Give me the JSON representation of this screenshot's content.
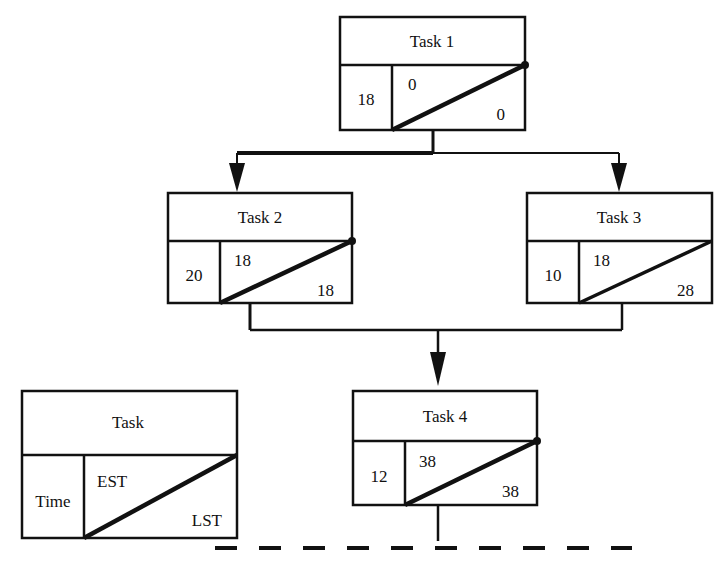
{
  "diagram": {
    "type": "precedence-network-diagram",
    "title_text": "",
    "stroke_color": "#111111",
    "background_color": "#ffffff",
    "nodes": [
      {
        "id": "task-1",
        "label": "Task 1",
        "time": "18",
        "est": "0",
        "lst": "0",
        "box": {
          "x": 340,
          "y": 17,
          "w": 185,
          "h": 113
        },
        "header_h": 48,
        "split_x": 52
      },
      {
        "id": "task-2",
        "label": "Task 2",
        "time": "20",
        "est": "18",
        "lst": "18",
        "box": {
          "x": 168,
          "y": 193,
          "w": 184,
          "h": 110
        },
        "header_h": 48,
        "split_x": 52
      },
      {
        "id": "task-3",
        "label": "Task 3",
        "time": "10",
        "est": "18",
        "lst": "28",
        "box": {
          "x": 527,
          "y": 193,
          "w": 185,
          "h": 110
        },
        "header_h": 48,
        "split_x": 52
      },
      {
        "id": "task-4",
        "label": "Task 4",
        "time": "12",
        "est": "38",
        "lst": "38",
        "box": {
          "x": 353,
          "y": 391,
          "w": 184,
          "h": 114
        },
        "header_h": 48,
        "split_x": 52
      }
    ],
    "legend": {
      "id": "legend-key",
      "label": "Task",
      "time": "Time",
      "est": "EST",
      "lst": "LST",
      "box": {
        "x": 22,
        "y": 391,
        "w": 215,
        "h": 147
      },
      "header_h": 64,
      "split_x": 62
    },
    "connectors": [
      {
        "id": "task1-to-task2",
        "from": "task-1",
        "to": "task-2",
        "style": "elbow-down-left-arrow"
      },
      {
        "id": "task1-to-task3",
        "from": "task-1",
        "to": "task-3",
        "style": "elbow-down-right-arrow"
      },
      {
        "id": "task2-to-task4",
        "from": "task-2",
        "to": "task-4",
        "style": "elbow-down-merge-arrow"
      },
      {
        "id": "task3-to-task4",
        "from": "task-3",
        "to": "task-4",
        "style": "elbow-down-merge-arrow"
      },
      {
        "id": "task4-to-baseline",
        "from": "task-4",
        "to": "baseline",
        "style": "plain-line"
      }
    ],
    "baseline": {
      "id": "dashed-baseline",
      "x1": 215,
      "x2": 632,
      "y": 548,
      "dash": "22 22"
    }
  }
}
